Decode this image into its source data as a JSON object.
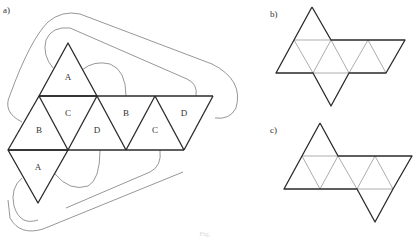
{
  "figure": {
    "caption": "Fig.",
    "panels": [
      {
        "id": "a",
        "label": "a)",
        "description": "Net of an octahedron with labeled faces and gluing arcs",
        "faces": [
          "A",
          "B",
          "C",
          "D",
          "B",
          "C",
          "D",
          "A"
        ]
      },
      {
        "id": "b",
        "label": "b)",
        "description": "Octahedron net: strip of six triangles with one triangle above and one below"
      },
      {
        "id": "c",
        "label": "c)",
        "description": "Octahedron net: strip of six triangles with one triangle above left and one below right"
      }
    ]
  },
  "colors": {
    "line": "#2a2a2a",
    "inner_line": "#8a8a8a",
    "arc": "#6a6a6a",
    "background": "#ffffff"
  }
}
